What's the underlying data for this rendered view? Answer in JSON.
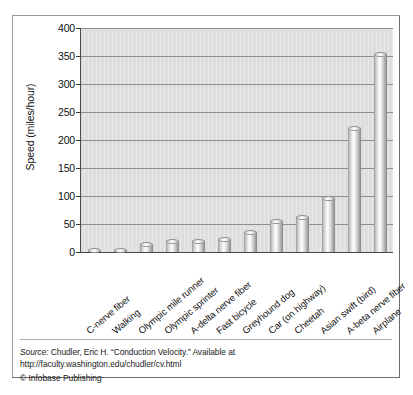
{
  "chart_data": {
    "type": "bar",
    "title": "",
    "xlabel": "",
    "ylabel": "Speed (miles/hour)",
    "ylim": [
      0,
      400
    ],
    "ytick_step": 50,
    "yticks": [
      400,
      350,
      300,
      250,
      200,
      150,
      100,
      50,
      0
    ],
    "grid": true,
    "legend": "none",
    "categories": [
      "C-nerve fiber",
      "Walking",
      "Olympic mile runner",
      "Olympic sprinter",
      "A-delta nerve fiber",
      "Fast bicycle",
      "Greyhound dog",
      "Car (on highway)",
      "Cheetah",
      "Asian swift (bird)",
      "A-beta nerve fiber",
      "Airplane"
    ],
    "values": [
      2,
      3,
      13,
      18,
      18,
      22,
      35,
      55,
      62,
      96,
      220,
      353
    ],
    "bar_style": "3d-cylinder-grayscale"
  },
  "footer": {
    "source_label": "Source:",
    "source_text": " Chudler, Eric H. “Conduction Velocity.” Available at http://faculty.washington.edu/chudler/cv.html",
    "copyright": "© Infobase Publishing"
  },
  "colors": {
    "plot_background": "#dedede",
    "gridline": "#8d8d8d",
    "axis": "#4a4a4a",
    "frame_border": "#9a9a9a",
    "text": "#111111"
  }
}
